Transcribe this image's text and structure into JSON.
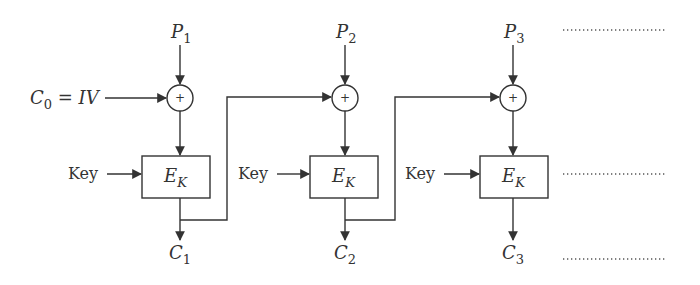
{
  "diagram": {
    "type": "CBC mode encryption",
    "stroke_color": "#333333",
    "iv_label": {
      "C": "C",
      "sub": "0",
      "eq": " = IV"
    },
    "key_label": "Key",
    "cipher_label": {
      "E": "E",
      "sub": "K"
    },
    "xor_symbol": "+",
    "stages": [
      {
        "plain": "P",
        "plain_sub": "1",
        "cipher": "C",
        "cipher_sub": "1"
      },
      {
        "plain": "P",
        "plain_sub": "2",
        "cipher": "C",
        "cipher_sub": "2"
      },
      {
        "plain": "P",
        "plain_sub": "3",
        "cipher": "C",
        "cipher_sub": "3"
      }
    ],
    "continuation": "........................"
  }
}
